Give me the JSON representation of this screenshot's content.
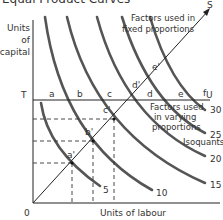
{
  "title": "Equal Product Curves",
  "axes": {
    "y_label_lines": [
      "Units",
      "of",
      "capital"
    ],
    "x_label": "Units of labour",
    "origin_label": "0"
  },
  "lines": {
    "horizontal_start": "T",
    "horizontal_end": "U",
    "diagonal_end": "S"
  },
  "annotations": {
    "fixed_line1": "Factors used in",
    "fixed_line2": "fixed proportions",
    "varying_line1": "Factors used",
    "varying_line2": "in varying",
    "varying_line3": "proportions",
    "isoquants": "Isoquants"
  },
  "points_on_T": [
    "a",
    "b",
    "c",
    "d",
    "e",
    "f"
  ],
  "points_on_diagonal": [
    "a'",
    "b'",
    "c'",
    "d'",
    "e'"
  ],
  "isoquant_labels": [
    "5",
    "10",
    "15",
    "20",
    "25",
    "30"
  ],
  "colors": {
    "curve": "#555555",
    "axis": "#222222",
    "text": "#333333"
  }
}
